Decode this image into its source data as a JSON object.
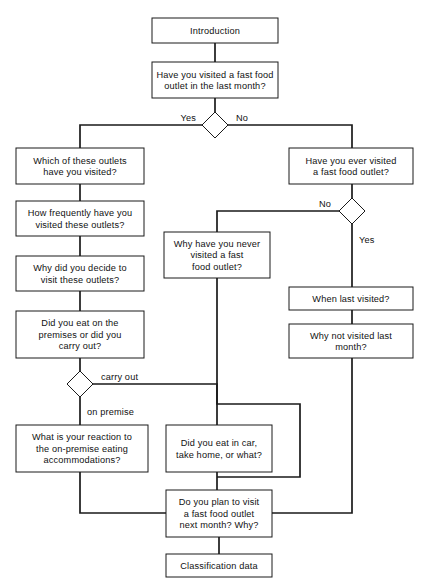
{
  "diagram": {
    "type": "flowchart",
    "background_color": "#ffffff",
    "line_color": "#1a1a1a",
    "text_color": "#111111",
    "nodes": [
      {
        "id": "introduction",
        "shape": "box",
        "lines": [
          "Introduction"
        ],
        "x": 152,
        "y": 18,
        "w": 126,
        "h": 25
      },
      {
        "id": "visited-last-month",
        "shape": "box",
        "lines": [
          "Have you visited a fast food",
          "outlet in the last month?"
        ],
        "x": 152,
        "y": 62,
        "w": 126,
        "h": 36
      },
      {
        "id": "decision-visited-last-month",
        "shape": "diamond",
        "lines": [],
        "cx": 215,
        "cy": 125,
        "rx": 13,
        "ry": 13
      },
      {
        "id": "which-outlets",
        "shape": "box",
        "lines": [
          "Which of these outlets",
          "have you visited?"
        ],
        "x": 16,
        "y": 148,
        "w": 128,
        "h": 36
      },
      {
        "id": "how-frequently",
        "shape": "box",
        "lines": [
          "How frequently have you",
          "visited these outlets?"
        ],
        "x": 16,
        "y": 201,
        "w": 128,
        "h": 35
      },
      {
        "id": "why-decide-visit",
        "shape": "box",
        "lines": [
          "Why did you decide to",
          "visit these outlets?"
        ],
        "x": 16,
        "y": 256,
        "w": 128,
        "h": 35
      },
      {
        "id": "eat-on-premises",
        "shape": "box",
        "lines": [
          "Did you eat on the",
          "premises or did you",
          "carry out?"
        ],
        "x": 16,
        "y": 311,
        "w": 128,
        "h": 47
      },
      {
        "id": "decision-premise-carryout",
        "shape": "diamond",
        "cx": 80,
        "cy": 384,
        "rx": 13,
        "ry": 13,
        "lines": []
      },
      {
        "id": "reaction-on-premise",
        "shape": "box",
        "lines": [
          "What is your reaction to",
          "the on-premise eating",
          "accommodations?"
        ],
        "x": 16,
        "y": 425,
        "w": 132,
        "h": 47
      },
      {
        "id": "eat-in-car",
        "shape": "box",
        "lines": [
          "Did you eat in car,",
          "take home, or what?"
        ],
        "x": 166,
        "y": 425,
        "w": 106,
        "h": 47
      },
      {
        "id": "ever-visited",
        "shape": "box",
        "lines": [
          "Have you ever visited",
          "a fast food outlet?"
        ],
        "x": 289,
        "y": 148,
        "w": 124,
        "h": 36
      },
      {
        "id": "decision-ever-visited",
        "shape": "diamond",
        "cx": 352,
        "cy": 211,
        "rx": 13,
        "ry": 13,
        "lines": []
      },
      {
        "id": "why-never-visited",
        "shape": "box",
        "lines": [
          "Why have you never",
          "visited a fast",
          "food outlet?"
        ],
        "x": 164,
        "y": 232,
        "w": 106,
        "h": 46
      },
      {
        "id": "when-last-visited",
        "shape": "box",
        "lines": [
          "When last visited?"
        ],
        "x": 289,
        "y": 287,
        "w": 124,
        "h": 23
      },
      {
        "id": "why-not-visited-last-month",
        "shape": "box",
        "lines": [
          "Why not visited last",
          "month?"
        ],
        "x": 289,
        "y": 324,
        "w": 124,
        "h": 34
      },
      {
        "id": "plan-to-visit",
        "shape": "box",
        "lines": [
          "Do you plan to visit",
          "a fast food outlet",
          "next month? Why?"
        ],
        "x": 166,
        "y": 490,
        "w": 106,
        "h": 47
      },
      {
        "id": "classification-data",
        "shape": "box",
        "lines": [
          "Classification data"
        ],
        "x": 166,
        "y": 554,
        "w": 106,
        "h": 23
      }
    ],
    "edges": [
      {
        "id": "intro-to-visited",
        "d": "M 215 43 L 215 62"
      },
      {
        "id": "visited-to-decision",
        "d": "M 215 98 L 215 112"
      },
      {
        "id": "decision-yes-branch",
        "d": "M 202 125 L 80 125 L 80 148"
      },
      {
        "id": "decision-no-branch",
        "d": "M 228 125 L 352 125 L 352 148"
      },
      {
        "id": "which-to-frequently",
        "d": "M 80 184 L 80 201"
      },
      {
        "id": "frequently-to-whydecide",
        "d": "M 80 236 L 80 256"
      },
      {
        "id": "whydecide-to-eatpremises",
        "d": "M 80 291 L 80 311"
      },
      {
        "id": "eatpremises-to-decision",
        "d": "M 80 358 L 80 371"
      },
      {
        "id": "carryout-branch",
        "d": "M 93 384 L 217 384 L 217 425"
      },
      {
        "id": "onpremise-branch",
        "d": "M 80 397 L 80 425"
      },
      {
        "id": "reaction-to-plan",
        "d": "M 80 472 L 80 513 L 166 513"
      },
      {
        "id": "eatincar-to-plan",
        "d": "M 217 472 L 217 490"
      },
      {
        "id": "everviewed-to-decision",
        "d": "M 352 184 L 352 198"
      },
      {
        "id": "ever-no-branch",
        "d": "M 339 211 L 217 211 L 217 232"
      },
      {
        "id": "ever-yes-branch",
        "d": "M 352 224 L 352 287"
      },
      {
        "id": "whenlast-to-whynot",
        "d": "M 352 310 L 352 324"
      },
      {
        "id": "whynot-to-plan",
        "d": "M 352 358 L 352 513 L 272 513"
      },
      {
        "id": "whynever-to-plan",
        "d": "M 217 278 L 217 404 L 300 404 L 300 477 L 217 477"
      },
      {
        "id": "plan-to-classification",
        "d": "M 219 537 L 219 554"
      }
    ],
    "edge_labels": [
      {
        "id": "label-yes-last-month",
        "text": "Yes",
        "x": 196,
        "y": 121,
        "anchor": "end"
      },
      {
        "id": "label-no-last-month",
        "text": "No",
        "x": 236,
        "y": 121,
        "anchor": "start"
      },
      {
        "id": "label-no-ever",
        "text": "No",
        "x": 331,
        "y": 207,
        "anchor": "end"
      },
      {
        "id": "label-yes-ever",
        "text": "Yes",
        "x": 359,
        "y": 243,
        "anchor": "start"
      },
      {
        "id": "label-carry-out",
        "text": "carry out",
        "x": 101,
        "y": 380,
        "anchor": "start"
      },
      {
        "id": "label-on-premise",
        "text": "on premise",
        "x": 87,
        "y": 415,
        "anchor": "start"
      }
    ]
  }
}
